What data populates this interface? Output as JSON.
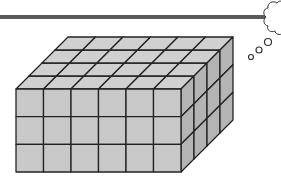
{
  "diagram": {
    "type": "isometric-cube-prism",
    "dimensions": {
      "length": 6,
      "width": 4,
      "height": 3
    },
    "unit_cube_count": 72,
    "colors": {
      "top_face": "#d0d0d0",
      "front_face": "#c8c8c8",
      "side_face": "#b4b4b4",
      "edge": "#222222",
      "bar": "#5a5a5a",
      "thought_bubble": "#333333"
    }
  },
  "decorations": {
    "top_bar": "horizontal-rule",
    "thought_bubble": "thought-cloud-icon"
  }
}
